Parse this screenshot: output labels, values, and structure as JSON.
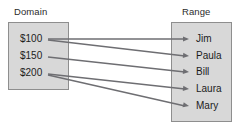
{
  "diagram": {
    "type": "mapping-diagram",
    "columns": {
      "domain": {
        "title": "Domain",
        "items": [
          {
            "id": "d1",
            "label": "$100",
            "y": 39
          },
          {
            "id": "d2",
            "label": "$150",
            "y": 56
          },
          {
            "id": "d3",
            "label": "$200",
            "y": 73
          }
        ]
      },
      "range": {
        "title": "Range",
        "items": [
          {
            "id": "r1",
            "label": "Jim",
            "y": 39
          },
          {
            "id": "r2",
            "label": "Paula",
            "y": 56
          },
          {
            "id": "r3",
            "label": "Bill",
            "y": 72
          },
          {
            "id": "r4",
            "label": "Laura",
            "y": 89
          },
          {
            "id": "r5",
            "label": "Mary",
            "y": 106
          }
        ]
      }
    },
    "mappings": [
      {
        "from": "$100",
        "to": "Jim",
        "from_y": 39,
        "to_y": 39
      },
      {
        "from": "$100",
        "to": "Paula",
        "from_y": 40,
        "to_y": 56
      },
      {
        "from": "$150",
        "to": "Bill",
        "from_y": 57,
        "to_y": 72
      },
      {
        "from": "$200",
        "to": "Laura",
        "from_y": 74,
        "to_y": 89
      },
      {
        "from": "$200",
        "to": "Mary",
        "from_y": 75,
        "to_y": 106
      }
    ],
    "colors": {
      "box_fill": "#d8d8d8",
      "box_border": "#8e8e8e",
      "arrow": "#6e6e72",
      "text": "#1c1c1c",
      "background": "#ffffff"
    }
  }
}
